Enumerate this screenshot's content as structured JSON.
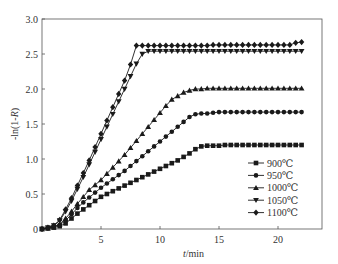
{
  "chart_data": {
    "type": "line",
    "title": "",
    "xlabel": "t/min",
    "ylabel": "-ln(1-R)",
    "xlim": [
      0,
      23.7
    ],
    "ylim": [
      0,
      3.0
    ],
    "xticks": [
      5,
      10,
      15,
      20
    ],
    "yticks": [
      "0",
      "0.5",
      "1.0",
      "1.5",
      "2.0",
      "2.5",
      "3.0"
    ],
    "grid": false,
    "legend_position": "lower right",
    "series": [
      {
        "name": "900℃",
        "marker": "square",
        "x": [
          0,
          0.5,
          1,
          1.5,
          2,
          2.5,
          3,
          3.5,
          4,
          4.5,
          5,
          5.5,
          6,
          6.5,
          7,
          7.5,
          8,
          8.5,
          9,
          9.5,
          10,
          10.5,
          11,
          11.5,
          12,
          12.5,
          13,
          13.5,
          14,
          14.5,
          15,
          15.5,
          16,
          16.5,
          17,
          17.5,
          18,
          18.5,
          19,
          19.5,
          20,
          20.5,
          21,
          21.5,
          22
        ],
        "y": [
          0,
          0.01,
          0.02,
          0.04,
          0.08,
          0.15,
          0.22,
          0.28,
          0.34,
          0.4,
          0.46,
          0.5,
          0.54,
          0.58,
          0.62,
          0.66,
          0.7,
          0.74,
          0.78,
          0.82,
          0.86,
          0.9,
          0.94,
          0.98,
          1.03,
          1.08,
          1.14,
          1.18,
          1.19,
          1.19,
          1.19,
          1.2,
          1.2,
          1.2,
          1.2,
          1.2,
          1.2,
          1.2,
          1.2,
          1.2,
          1.2,
          1.2,
          1.2,
          1.2,
          1.2
        ]
      },
      {
        "name": "950℃",
        "marker": "circle",
        "x": [
          0,
          0.5,
          1,
          1.5,
          2,
          2.5,
          3,
          3.5,
          4,
          4.5,
          5,
          5.5,
          6,
          6.5,
          7,
          7.5,
          8,
          8.5,
          9,
          9.5,
          10,
          10.5,
          11,
          11.5,
          12,
          12.5,
          13,
          13.5,
          14,
          14.5,
          15,
          15.5,
          16,
          16.5,
          17,
          17.5,
          18,
          18.5,
          19,
          19.5,
          20,
          20.5,
          21,
          21.5,
          22
        ],
        "y": [
          0,
          0.01,
          0.03,
          0.06,
          0.12,
          0.21,
          0.3,
          0.38,
          0.45,
          0.52,
          0.59,
          0.65,
          0.71,
          0.77,
          0.83,
          0.9,
          0.97,
          1.04,
          1.11,
          1.18,
          1.25,
          1.32,
          1.39,
          1.46,
          1.53,
          1.6,
          1.64,
          1.65,
          1.65,
          1.66,
          1.67,
          1.67,
          1.67,
          1.67,
          1.67,
          1.67,
          1.67,
          1.67,
          1.67,
          1.67,
          1.67,
          1.67,
          1.67,
          1.67,
          1.67
        ]
      },
      {
        "name": "1000℃",
        "marker": "triangle-up",
        "x": [
          0,
          0.5,
          1,
          1.5,
          2,
          2.5,
          3,
          3.5,
          4,
          4.5,
          5,
          5.5,
          6,
          6.5,
          7,
          7.5,
          8,
          8.5,
          9,
          9.5,
          10,
          10.5,
          11,
          11.5,
          12,
          12.5,
          13,
          13.5,
          14,
          14.5,
          15,
          15.5,
          16,
          16.5,
          17,
          17.5,
          18,
          18.5,
          19,
          19.5,
          20,
          20.5,
          21,
          21.5,
          22
        ],
        "y": [
          0,
          0.01,
          0.03,
          0.07,
          0.15,
          0.25,
          0.36,
          0.46,
          0.56,
          0.63,
          0.7,
          0.79,
          0.88,
          0.97,
          1.06,
          1.16,
          1.26,
          1.36,
          1.46,
          1.56,
          1.66,
          1.76,
          1.85,
          1.9,
          1.95,
          1.98,
          2.0,
          2.0,
          2.01,
          2.01,
          2.01,
          2.01,
          2.01,
          2.01,
          2.01,
          2.01,
          2.01,
          2.01,
          2.01,
          2.01,
          2.01,
          2.01,
          2.01,
          2.01,
          2.01
        ]
      },
      {
        "name": "1050℃",
        "marker": "triangle-down",
        "x": [
          0,
          0.5,
          1,
          1.5,
          2,
          2.5,
          3,
          3.5,
          4,
          4.5,
          5,
          5.5,
          6,
          6.5,
          7,
          7.5,
          8,
          8.5,
          9,
          9.5,
          10,
          10.5,
          11,
          11.5,
          12,
          12.5,
          13,
          13.5,
          14,
          14.5,
          15,
          15.5,
          16,
          16.5,
          17,
          17.5,
          18,
          18.5,
          19,
          19.5,
          20,
          20.5,
          21,
          21.5,
          22
        ],
        "y": [
          0,
          0.02,
          0.05,
          0.12,
          0.25,
          0.4,
          0.57,
          0.74,
          0.92,
          1.1,
          1.28,
          1.46,
          1.64,
          1.82,
          2.0,
          2.18,
          2.36,
          2.5,
          2.54,
          2.54,
          2.54,
          2.54,
          2.54,
          2.54,
          2.54,
          2.54,
          2.54,
          2.54,
          2.54,
          2.54,
          2.54,
          2.54,
          2.54,
          2.54,
          2.54,
          2.54,
          2.54,
          2.54,
          2.54,
          2.54,
          2.54,
          2.54,
          2.54,
          2.54,
          2.54
        ]
      },
      {
        "name": "1100℃",
        "marker": "diamond",
        "x": [
          0,
          0.5,
          1,
          1.5,
          2,
          2.5,
          3,
          3.5,
          4,
          4.5,
          5,
          5.5,
          6,
          6.5,
          7,
          7.5,
          8,
          8.5,
          9,
          9.5,
          10,
          10.5,
          11,
          11.5,
          12,
          12.5,
          13,
          13.5,
          14,
          14.5,
          15,
          15.5,
          16,
          16.5,
          17,
          17.5,
          18,
          18.5,
          19,
          19.5,
          20,
          20.5,
          21,
          21.5,
          22
        ],
        "y": [
          0,
          0.02,
          0.05,
          0.13,
          0.28,
          0.44,
          0.62,
          0.8,
          0.98,
          1.17,
          1.36,
          1.55,
          1.74,
          1.93,
          2.12,
          2.35,
          2.62,
          2.62,
          2.62,
          2.62,
          2.62,
          2.62,
          2.62,
          2.62,
          2.62,
          2.62,
          2.62,
          2.62,
          2.62,
          2.63,
          2.63,
          2.63,
          2.63,
          2.63,
          2.63,
          2.63,
          2.63,
          2.63,
          2.63,
          2.63,
          2.63,
          2.63,
          2.63,
          2.66,
          2.67
        ]
      }
    ]
  },
  "colors": {
    "line": "#1a1a1a",
    "axis": "#555555",
    "text": "#333333"
  }
}
